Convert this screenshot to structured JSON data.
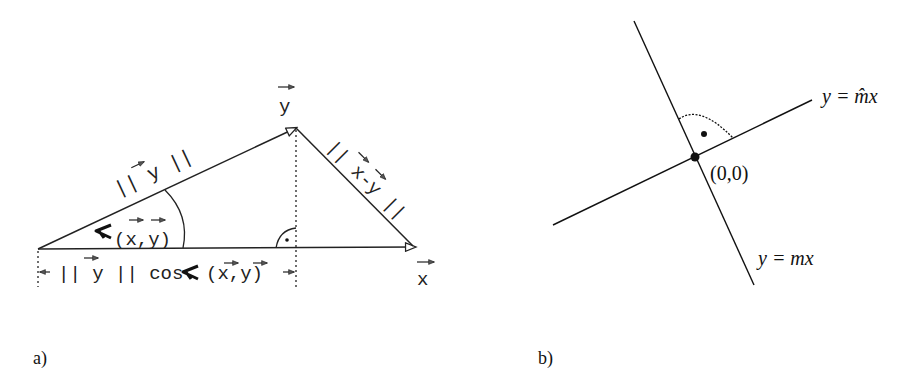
{
  "panel_a": {
    "label": "a)",
    "vector_x_label": "x",
    "vector_y_label": "y",
    "norm_y_label": "|| y ||",
    "norm_diff_label": "|| x-y ||",
    "angle_label": "(x,y)",
    "projection_label_prefix": "|| y || cos",
    "projection_label_suffix": "(x,y)"
  },
  "panel_b": {
    "label": "b)",
    "line_hat_label": "y = m̂x",
    "line_m_label": "y = mx",
    "origin_label": "(0,0)"
  },
  "colors": {
    "stroke": "#222222",
    "background": "#ffffff"
  }
}
